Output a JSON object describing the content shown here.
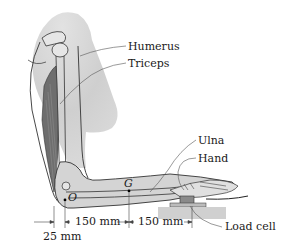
{
  "figure": {
    "labels": {
      "humerus": "Humerus",
      "triceps": "Triceps",
      "ulna": "Ulna",
      "hand": "Hand",
      "load_cell": "Load cell",
      "point_g": "G",
      "point_o": "O"
    },
    "dimensions": {
      "d1": "150 mm",
      "d2": "150 mm",
      "d3": "25 mm"
    },
    "colors": {
      "skin_fill": "#d4d4d4",
      "muscle_fill": "#6e6e6e",
      "bone_fill": "#e6e6e6",
      "outline": "#333333",
      "leader": "#555555",
      "platform": "#c8c8c8"
    }
  }
}
